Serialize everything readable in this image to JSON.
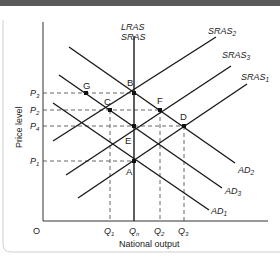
{
  "figure": {
    "y_axis_label": "Price level",
    "x_axis_label": "National output",
    "origin_label": "O",
    "vertical_curve_labels": [
      "LRAS",
      "SRAS"
    ]
  },
  "curves": {
    "sras2": {
      "base": "SRAS",
      "sub": "2"
    },
    "sras3": {
      "base": "SRAS",
      "sub": "3"
    },
    "sras1": {
      "base": "SRAS",
      "sub": "1"
    },
    "ad2": {
      "base": "AD",
      "sub": "2"
    },
    "ad3": {
      "base": "AD",
      "sub": "3"
    },
    "ad1": {
      "base": "AD",
      "sub": "1"
    }
  },
  "price_ticks": {
    "p3": {
      "base": "P",
      "sub": "3"
    },
    "p2": {
      "base": "P",
      "sub": "2"
    },
    "p4": {
      "base": "P",
      "sub": "4"
    },
    "p1": {
      "base": "P",
      "sub": "1"
    }
  },
  "output_ticks": {
    "q1": {
      "base": "Q",
      "sub": "1"
    },
    "qn": {
      "base": "Q",
      "sub": "n"
    },
    "q2": {
      "base": "Q",
      "sub": "2"
    },
    "q3": {
      "base": "Q",
      "sub": "3"
    }
  },
  "points": {
    "g": "G",
    "b": "B",
    "c": "C",
    "f": "F",
    "e": "E",
    "d": "D",
    "a": "A"
  },
  "colors": {
    "line": "#1a1a1a",
    "dash": "#555555",
    "topbar": "#5a5a5a"
  }
}
